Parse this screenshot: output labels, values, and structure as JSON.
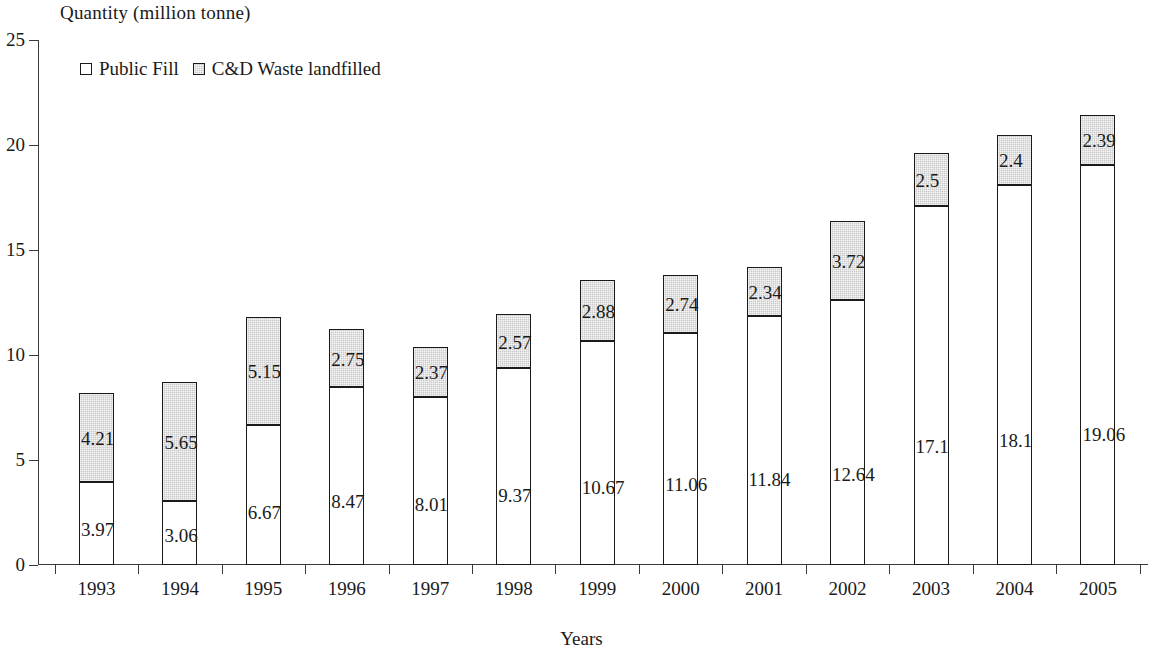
{
  "chart_data": {
    "type": "bar",
    "subtype": "stacked",
    "title": "Quantity (million tonne)",
    "xlabel": "Years",
    "ylabel": "Quantity (million tonne)",
    "ylim": [
      0,
      25
    ],
    "yticks": [
      0,
      5,
      10,
      15,
      20,
      25
    ],
    "grid": false,
    "legend_position": "top-left",
    "categories": [
      "1993",
      "1994",
      "1995",
      "1996",
      "1997",
      "1998",
      "1999",
      "2000",
      "2001",
      "2002",
      "2003",
      "2004",
      "2005"
    ],
    "series": [
      {
        "name": "Public Fill",
        "color": "#ffffff",
        "values": [
          3.97,
          3.06,
          6.67,
          8.47,
          8.01,
          9.37,
          10.67,
          11.06,
          11.84,
          12.64,
          17.1,
          18.1,
          19.06
        ],
        "labels": [
          "3.97",
          "3.06",
          "6.67",
          "8.47",
          "8.01",
          "9.37",
          "10.67",
          "11.06",
          "11.84",
          "12.64",
          "17.1",
          "18.1",
          "19.06"
        ]
      },
      {
        "name": "C&D Waste landfilled",
        "color": "#c9c9c9",
        "values": [
          4.21,
          5.65,
          5.15,
          2.75,
          2.37,
          2.57,
          2.88,
          2.74,
          2.34,
          3.72,
          2.5,
          2.4,
          2.39
        ],
        "labels": [
          "4.21",
          "5.65",
          "5.15",
          "2.75",
          "2.37",
          "2.57",
          "2.88",
          "2.74",
          "2.34",
          "3.72",
          "2.5",
          "2.4",
          "2.39"
        ]
      }
    ],
    "totals": [
      8.18,
      8.71,
      11.82,
      11.22,
      10.38,
      11.94,
      13.55,
      13.8,
      14.18,
      16.36,
      19.6,
      20.5,
      21.45
    ]
  },
  "axis": {
    "y_title": "Quantity (million tonne)",
    "x_title": "Years",
    "y_tick_labels": [
      "0",
      "5",
      "10",
      "15",
      "20",
      "25"
    ]
  },
  "legend": {
    "items": [
      {
        "label": "Public Fill",
        "swatch": "white-square-icon"
      },
      {
        "label": "C&D Waste landfilled",
        "swatch": "gray-square-icon"
      }
    ]
  }
}
